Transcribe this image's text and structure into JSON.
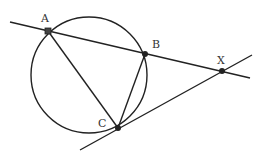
{
  "diagram": {
    "type": "geometry",
    "points": [
      {
        "label": "A",
        "x": 48,
        "y": 31
      },
      {
        "label": "B",
        "x": 145,
        "y": 54
      },
      {
        "label": "C",
        "x": 118,
        "y": 128
      },
      {
        "label": "X",
        "x": 222,
        "y": 71
      }
    ],
    "circle": {
      "cx": 89,
      "cy": 75,
      "r": 58
    },
    "segments": [
      [
        "A",
        "C"
      ],
      [
        "B",
        "C"
      ]
    ],
    "lines": [
      {
        "name": "secant-AX",
        "x1": 10,
        "y1": 22,
        "x2": 250,
        "y2": 78
      },
      {
        "name": "tangent-CX",
        "x1": 80,
        "y1": 150,
        "x2": 252,
        "y2": 55
      }
    ]
  }
}
